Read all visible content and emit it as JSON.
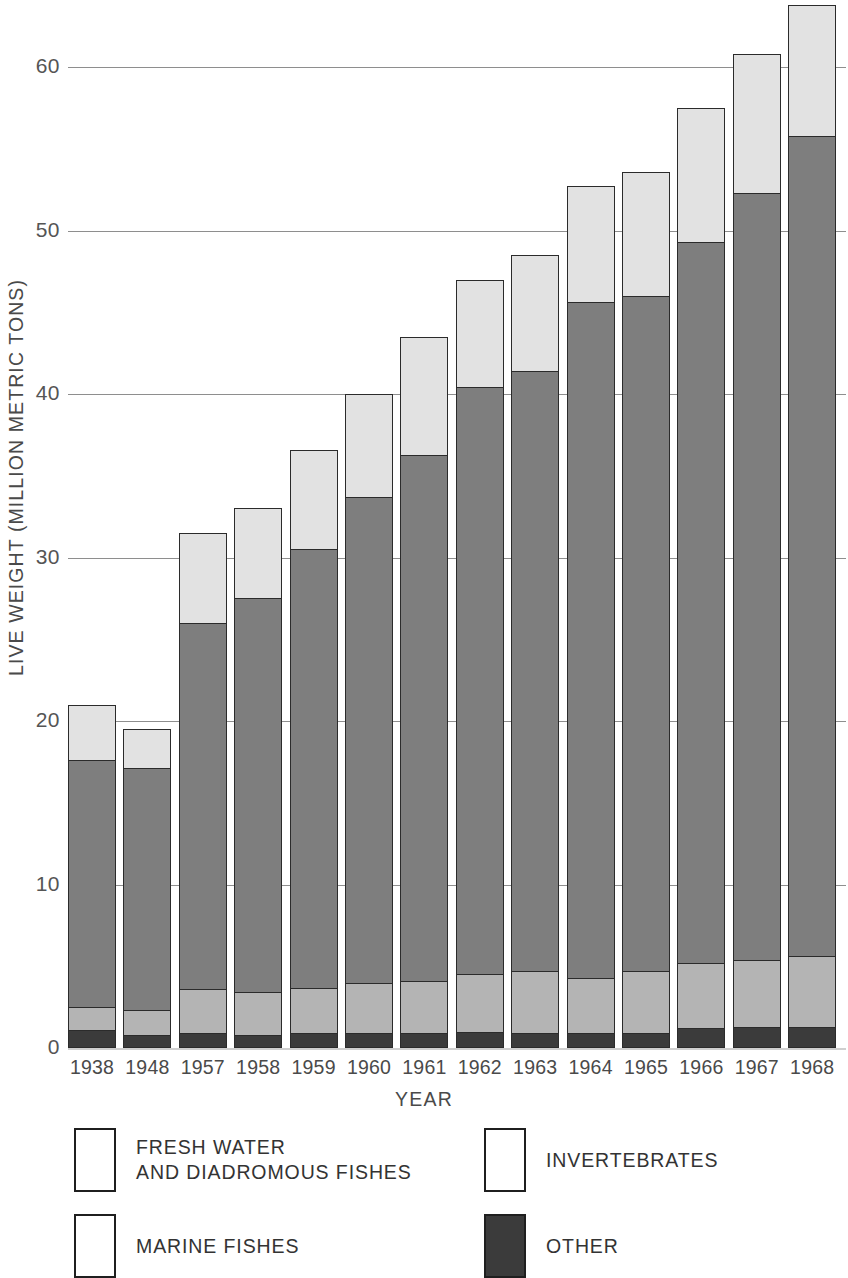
{
  "chart_data": {
    "type": "bar",
    "stacked": true,
    "title": "",
    "xlabel": "YEAR",
    "ylabel": "LIVE WEIGHT (MILLION METRIC TONS)",
    "ylim": [
      0,
      64
    ],
    "yticks": [
      0,
      10,
      20,
      30,
      40,
      50,
      60
    ],
    "ytick_labels": [
      "0",
      "10",
      "20",
      "30",
      "40",
      "50",
      "60"
    ],
    "grid": true,
    "grid_axis": "y",
    "legend_position": "below-plot",
    "categories": [
      "1938",
      "1948",
      "1957",
      "1958",
      "1959",
      "1960",
      "1961",
      "1962",
      "1963",
      "1964",
      "1965",
      "1966",
      "1967",
      "1968"
    ],
    "series": [
      {
        "name": "OTHER",
        "color": "#3b3b3b",
        "values": [
          1.1,
          0.8,
          0.9,
          0.8,
          0.9,
          0.9,
          0.9,
          1.0,
          0.9,
          0.9,
          0.9,
          1.2,
          1.3,
          1.3
        ]
      },
      {
        "name": "FRESH WATER AND DIADROMOUS FISHES",
        "color": "#b4b4b4",
        "values": [
          1.4,
          1.5,
          2.7,
          2.6,
          2.8,
          3.1,
          3.2,
          3.5,
          3.8,
          3.4,
          3.8,
          4.0,
          4.1,
          4.3
        ]
      },
      {
        "name": "MARINE FISHES",
        "color": "#7e7e7e",
        "values": [
          15.1,
          14.8,
          22.4,
          24.1,
          26.8,
          29.7,
          32.2,
          35.9,
          36.7,
          41.3,
          41.3,
          44.1,
          46.9,
          50.2
        ]
      },
      {
        "name": "INVERTEBRATES",
        "color": "#e2e2e2",
        "values": [
          3.4,
          2.4,
          5.5,
          5.5,
          6.1,
          6.3,
          7.2,
          6.6,
          7.1,
          7.1,
          7.6,
          8.2,
          8.5,
          8.0
        ]
      }
    ],
    "totals": [
      21.0,
      19.5,
      31.5,
      33.0,
      36.6,
      40.0,
      43.5,
      47.0,
      48.5,
      52.7,
      53.6,
      57.5,
      60.8,
      63.8
    ]
  },
  "axes": {
    "y_title": "LIVE WEIGHT (MILLION METRIC TONS)",
    "x_title": "YEAR"
  },
  "legend": {
    "items": [
      {
        "label": "FRESH WATER\nAND DIADROMOUS FISHES",
        "swatch": "white",
        "icon": "legend-swatch-icon"
      },
      {
        "label": "INVERTEBRATES",
        "swatch": "white",
        "icon": "legend-swatch-icon"
      },
      {
        "label": "MARINE FISHES",
        "swatch": "white",
        "icon": "legend-swatch-icon"
      },
      {
        "label": "OTHER",
        "swatch": "dark",
        "icon": "legend-swatch-icon"
      }
    ]
  },
  "colors": {
    "other": "#3b3b3b",
    "fresh_water": "#b4b4b4",
    "marine_fishes": "#7e7e7e",
    "invertebrates": "#e2e2e2",
    "gridline": "#8e8e8e",
    "outline": "#2b2b2b",
    "background": "#ffffff"
  }
}
